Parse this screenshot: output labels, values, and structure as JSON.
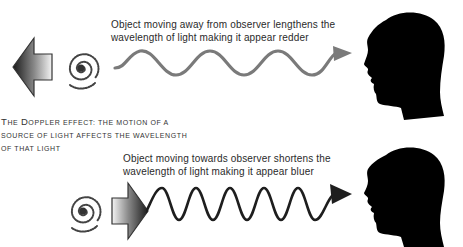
{
  "title": {
    "line1_first_cap": "T",
    "line1_rest_a": "he ",
    "line1_cap2": "D",
    "line1_rest_b": "oppler effect: the motion of a",
    "line2": "source of light affects the wavelength",
    "line3": "of that light"
  },
  "redshift": {
    "caption_line1": "Object moving away from observer lengthens the",
    "caption_line2": "wavelength of light making it appear redder",
    "direction": "away",
    "wave_color": "#7a7a7a",
    "wavelength": "long"
  },
  "blueshift": {
    "caption_line1": "Object moving towards observer shortens the",
    "caption_line2": "wavelength of light making it appear bluer",
    "direction": "towards",
    "wave_color": "#1e1e1e",
    "wavelength": "short"
  },
  "colors": {
    "silhouette": "#000000",
    "arrow_dark": "#1a1a1a",
    "arrow_light": "#f2f2f2",
    "text": "#2a2a2a"
  }
}
